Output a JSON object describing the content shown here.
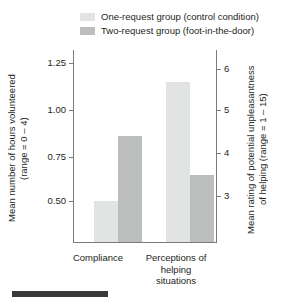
{
  "chart_data": {
    "type": "bar",
    "title": "",
    "categories": [
      "Compliance",
      "Perceptions of helping situations"
    ],
    "series": [
      {
        "name": "One-request group (control condition)",
        "color": "#e2e3e3",
        "values": [
          0.51,
          6.1
        ],
        "axis": [
          "left",
          "right"
        ]
      },
      {
        "name": "Two-request group (foot-in-the-door)",
        "color": "#bcbdbd",
        "values": [
          0.88,
          3.65
        ],
        "axis": [
          "left",
          "right"
        ]
      }
    ],
    "xlabel": "",
    "ylabel": "Mean number of hours volunteered (range = 0 – 4)",
    "ylabel_right": "Mean rating of potential unpleasantness of helping (range = 1 – 15)",
    "ylim": [
      0.275,
      1.38
    ],
    "ylim_right": [
      1.9,
      6.95
    ],
    "yticks": [
      "0.50",
      "0.75",
      "1.00",
      "1.25"
    ],
    "yticks_right": [
      "3",
      "4",
      "5",
      "6"
    ],
    "grid": false,
    "legend_position": "top"
  },
  "legend": {
    "items": [
      {
        "label": "One-request group (control condition)",
        "color": "#e2e3e3"
      },
      {
        "label": "Two-request group (foot-in-the-door)",
        "color": "#bcbdbd"
      }
    ]
  },
  "axes": {
    "left": {
      "title_line1": "Mean number of hours volunteered",
      "title_line2": "(range = 0 – 4)",
      "title": "Mean number of hours volunteered\n(range = 0 – 4)",
      "ticks": [
        {
          "label": "1.25",
          "value": 1.25
        },
        {
          "label": "1.00",
          "value": 1.0
        },
        {
          "label": "0.75",
          "value": 0.75
        },
        {
          "label": "0.50",
          "value": 0.5
        }
      ]
    },
    "right": {
      "title_line1": "Mean rating of potential unpleasantness",
      "title_line2": "of helping (range = 1 – 15)",
      "title": "Mean rating of potential unpleasantness\nof helping (range = 1 – 15)",
      "ticks": [
        {
          "label": "6",
          "value": 6
        },
        {
          "label": "5",
          "value": 5
        },
        {
          "label": "4",
          "value": 4
        },
        {
          "label": "3",
          "value": 3
        }
      ]
    },
    "categories": [
      {
        "label": "Compliance"
      },
      {
        "label": "Perceptions\nof helping\nsituations"
      }
    ]
  },
  "colors": {
    "series_light": "#e2e3e3",
    "series_dark": "#bcbdbd",
    "axis_line": "#7a7a7a",
    "text": "#231f20",
    "footer_rule": "#3a3a3a"
  }
}
